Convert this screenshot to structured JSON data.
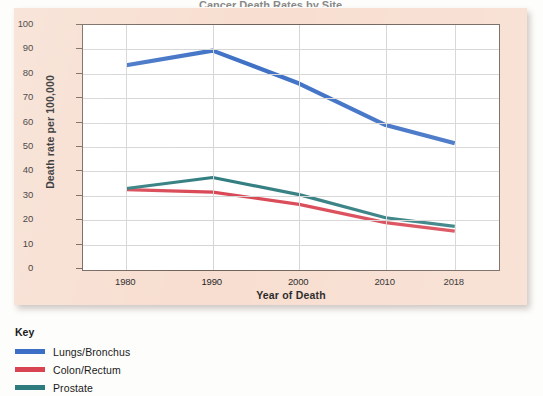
{
  "chart_data": {
    "type": "line",
    "title": "Cancer Death Rates by Site",
    "xlabel": "Year of Death",
    "ylabel": "Death rate per 100,000",
    "x": [
      1980,
      1990,
      2000,
      2010,
      2018
    ],
    "xtick_labels": [
      "1980",
      "1990",
      "2000",
      "2010",
      "2018"
    ],
    "ytick_labels": [
      "100",
      "90",
      "80",
      "70",
      "60",
      "50",
      "40",
      "30",
      "20",
      "10",
      "0"
    ],
    "ytick_values": [
      100,
      90,
      80,
      70,
      60,
      50,
      40,
      30,
      20,
      10,
      0
    ],
    "ylim": [
      0,
      100
    ],
    "xlim": [
      1975,
      2023
    ],
    "grid": true,
    "legend_position": "below-left",
    "legend_title": "Key",
    "series": [
      {
        "name": "Lungs/Bronchus",
        "color": "#3b6ec4",
        "values": [
          83.5,
          89.5,
          76.0,
          59.0,
          51.5
        ]
      },
      {
        "name": "Colon/Rectum",
        "color": "#d94452",
        "values": [
          32.5,
          31.5,
          26.5,
          19.0,
          15.5
        ]
      },
      {
        "name": "Prostate",
        "color": "#2e7b7e",
        "values": [
          33.0,
          37.5,
          30.5,
          21.0,
          17.5
        ]
      }
    ]
  },
  "colors": {
    "panel_background": "#f7ddcf",
    "plot_background": "#ffffff",
    "axis": "#6d5f57",
    "gridline": "#d4d4d4",
    "page_background": "#fdfdfb"
  }
}
